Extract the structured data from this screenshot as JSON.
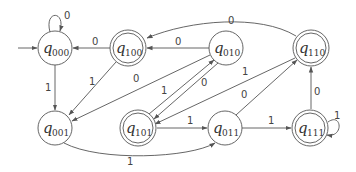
{
  "diagram": {
    "type": "finite-state-automaton",
    "start_state": "q000",
    "nodes": [
      {
        "id": "q000",
        "label": "q",
        "sub": "000",
        "x": 55,
        "y": 48,
        "accepting": false
      },
      {
        "id": "q100",
        "label": "q",
        "sub": "100",
        "x": 128,
        "y": 48,
        "accepting": true
      },
      {
        "id": "q010",
        "label": "q",
        "sub": "010",
        "x": 226,
        "y": 48,
        "accepting": false
      },
      {
        "id": "q110",
        "label": "q",
        "sub": "110",
        "x": 311,
        "y": 48,
        "accepting": true
      },
      {
        "id": "q001",
        "label": "q",
        "sub": "001",
        "x": 55,
        "y": 128,
        "accepting": false
      },
      {
        "id": "q101",
        "label": "q",
        "sub": "101",
        "x": 138,
        "y": 128,
        "accepting": true
      },
      {
        "id": "q011",
        "label": "q",
        "sub": "011",
        "x": 225,
        "y": 128,
        "accepting": false
      },
      {
        "id": "q111",
        "label": "q",
        "sub": "111",
        "x": 311,
        "y": 128,
        "accepting": true
      }
    ],
    "edges": [
      {
        "from": "q000",
        "to": "q000",
        "label": "0"
      },
      {
        "from": "q000",
        "to": "q001",
        "label": "1"
      },
      {
        "from": "q100",
        "to": "q000",
        "label": "0"
      },
      {
        "from": "q100",
        "to": "q001",
        "label": "1"
      },
      {
        "from": "q010",
        "to": "q100",
        "label": "0"
      },
      {
        "from": "q010",
        "to": "q001",
        "label": "0"
      },
      {
        "from": "q110",
        "to": "q100",
        "label": "0"
      },
      {
        "from": "q110",
        "to": "q101",
        "label": "1"
      },
      {
        "from": "q101",
        "to": "q010",
        "label": "1"
      },
      {
        "from": "q010",
        "to": "q101",
        "label": "0"
      },
      {
        "from": "q101",
        "to": "q011",
        "label": "1"
      },
      {
        "from": "q011",
        "to": "q110",
        "label": "0"
      },
      {
        "from": "q011",
        "to": "q111",
        "label": "1"
      },
      {
        "from": "q111",
        "to": "q110",
        "label": "0"
      },
      {
        "from": "q111",
        "to": "q111",
        "label": "1"
      },
      {
        "from": "q001",
        "to": "q011",
        "label": "1"
      }
    ],
    "labels": {
      "l_q000_loop": "0",
      "l_q000_q001": "1",
      "l_q100_q000": "0",
      "l_q100_q001": "1",
      "l_q010_q100": "0",
      "l_q010_q001": "0",
      "l_q110_q100": "0",
      "l_q110_q101": "1",
      "l_q101_q010": "1",
      "l_q010_q101": "0",
      "l_q101_q011": "1",
      "l_q011_q110": "0",
      "l_q011_q111": "1",
      "l_q111_q110": "0",
      "l_q111_loop": "1",
      "l_q001_q011": "1"
    },
    "node_text": {
      "q": "q",
      "s000": "000",
      "s100": "100",
      "s010": "010",
      "s110": "110",
      "s001": "001",
      "s101": "101",
      "s011": "011",
      "s111": "111"
    }
  }
}
